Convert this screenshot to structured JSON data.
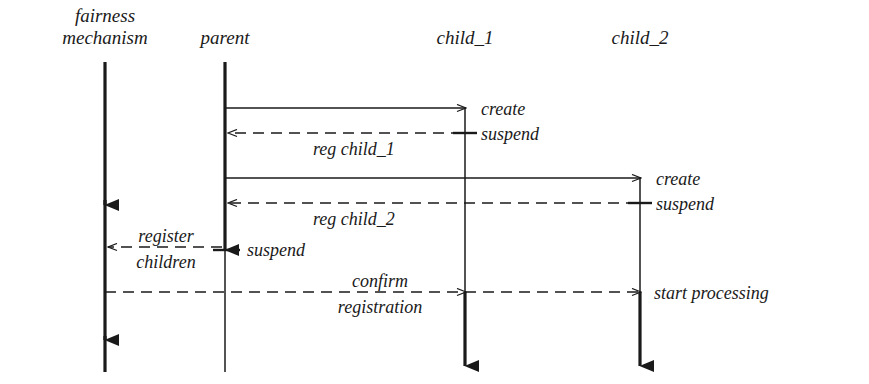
{
  "diagram": {
    "type": "sequence-diagram",
    "width": 869,
    "height": 384,
    "background": "#ffffff",
    "line_color": "#1a1a1a"
  },
  "lifelines": [
    {
      "id": "fairness",
      "label_line1": "fairness",
      "label_line2": "mechanism",
      "x": 105
    },
    {
      "id": "parent",
      "label_line1": "parent",
      "label_line2": "",
      "x": 225
    },
    {
      "id": "child_1",
      "label_line1": "child_1",
      "label_line2": "",
      "x": 465
    },
    {
      "id": "child_2",
      "label_line1": "child_2",
      "label_line2": "",
      "x": 640
    }
  ],
  "messages": [
    {
      "id": "create-child-1",
      "label": "create",
      "style": "solid",
      "from": "parent",
      "to": "child_1",
      "y": 108
    },
    {
      "id": "suspend-child-1",
      "label": "suspend",
      "style": "tick",
      "at": "child_1",
      "y": 133
    },
    {
      "id": "reg-child-1",
      "label": "reg child_1",
      "style": "dashed",
      "from": "child_1",
      "to": "parent",
      "y": 133
    },
    {
      "id": "create-child-2",
      "label": "create",
      "style": "solid",
      "from": "parent",
      "to": "child_2",
      "y": 178
    },
    {
      "id": "suspend-child-2",
      "label": "suspend",
      "style": "tick",
      "at": "child_2",
      "y": 203
    },
    {
      "id": "reg-child-2",
      "label": "reg child_2",
      "style": "dashed",
      "from": "child_2",
      "to": "parent",
      "y": 203
    },
    {
      "id": "register-children",
      "label_line1": "register",
      "label_line2": "children",
      "style": "dashed",
      "from": "parent",
      "to": "fairness",
      "y": 247
    },
    {
      "id": "suspend-parent",
      "label": "suspend",
      "style": "tick",
      "at": "parent",
      "y": 247
    },
    {
      "id": "confirm-registration",
      "label_line1": "confirm",
      "label_line2": "registration",
      "style": "dashed",
      "from": "fairness",
      "to": "child_2",
      "y": 292
    },
    {
      "id": "start-processing",
      "label": "start processing",
      "style": "note",
      "at": "child_2",
      "y": 292
    }
  ]
}
